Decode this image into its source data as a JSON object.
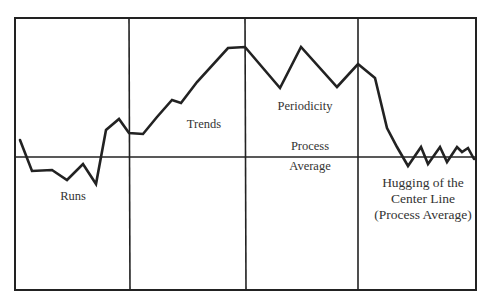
{
  "chart_data": {
    "type": "line",
    "title": "",
    "xlabel": "",
    "ylabel": "",
    "grid": false,
    "center_line": {
      "label_top": "Process",
      "label_bottom": "Average",
      "y": 157
    },
    "frame": {
      "x": 15,
      "y": 18,
      "width": 461,
      "height": 272
    },
    "dividers_x": [
      129,
      245,
      358
    ],
    "panels": [
      {
        "label": "Runs"
      },
      {
        "label": "Trends"
      },
      {
        "label": "Periodicity"
      },
      {
        "label": "Hugging of the Center Line (Process Average)"
      }
    ],
    "points": [
      [
        20,
        140
      ],
      [
        32,
        171
      ],
      [
        52,
        170
      ],
      [
        67,
        180
      ],
      [
        83,
        164
      ],
      [
        96,
        184
      ],
      [
        106,
        130
      ],
      [
        119,
        119
      ],
      [
        129,
        133
      ],
      [
        143,
        134
      ],
      [
        157,
        117
      ],
      [
        172,
        100
      ],
      [
        181,
        103
      ],
      [
        197,
        82
      ],
      [
        228,
        48
      ],
      [
        245,
        47
      ],
      [
        280,
        88
      ],
      [
        301,
        47
      ],
      [
        337,
        87
      ],
      [
        358,
        64
      ],
      [
        375,
        78
      ],
      [
        387,
        128
      ],
      [
        397,
        147
      ],
      [
        408,
        166
      ],
      [
        421,
        147
      ],
      [
        428,
        164
      ],
      [
        440,
        147
      ],
      [
        447,
        162
      ],
      [
        457,
        147
      ],
      [
        462,
        152
      ],
      [
        468,
        148
      ],
      [
        474,
        159
      ]
    ],
    "color": "#222222"
  },
  "labels": {
    "runs": "Runs",
    "trends": "Trends",
    "periodicity": "Periodicity",
    "process": "Process",
    "average": "Average",
    "hugging_line1": "Hugging of  the",
    "hugging_line2": "Center Line",
    "hugging_line3": "(Process Average)"
  }
}
